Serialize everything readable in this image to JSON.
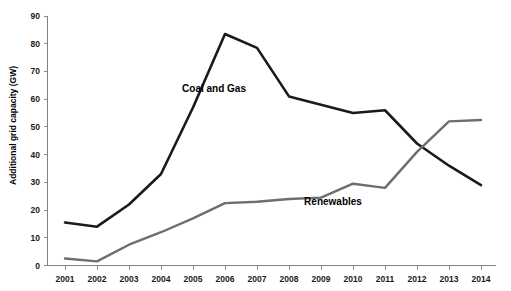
{
  "chart_data": {
    "type": "line",
    "title": "",
    "xlabel": "",
    "ylabel": "Additional grid capacity (GW)",
    "categories": [
      "2001",
      "2002",
      "2003",
      "2004",
      "2005",
      "2006",
      "2007",
      "2008",
      "2009",
      "2010",
      "2011",
      "2012",
      "2013",
      "2014"
    ],
    "ylim": [
      0,
      90
    ],
    "ytick_labels": [
      "0",
      "10",
      "20",
      "30",
      "40",
      "50",
      "60",
      "70",
      "80",
      "90"
    ],
    "ytick_values": [
      0,
      10,
      20,
      30,
      40,
      50,
      60,
      70,
      80,
      90
    ],
    "grid": false,
    "legend_position": "inline-annotations",
    "series": [
      {
        "name": "Coal and Gas",
        "color": "#1a1a1a",
        "label_x_category": "2005",
        "values": [
          15.5,
          14.0,
          22.0,
          33.0,
          57.0,
          83.5,
          78.5,
          61.0,
          58.0,
          55.0,
          56.0,
          44.0,
          36.0,
          29.0
        ]
      },
      {
        "name": "Renewables",
        "color": "#6e6e6e",
        "label_x_category": "2010",
        "values": [
          2.5,
          1.5,
          7.5,
          12.0,
          17.0,
          22.5,
          23.0,
          24.0,
          24.5,
          29.5,
          28.0,
          41.0,
          52.0,
          52.5
        ]
      }
    ],
    "annotations": [
      {
        "text": "Coal and Gas",
        "x_px": 214,
        "y_px": 92
      },
      {
        "text": "Renewables",
        "x_px": 333,
        "y_px": 205
      }
    ]
  },
  "axis": {
    "y_title": "Additional grid capacity (GW)"
  }
}
